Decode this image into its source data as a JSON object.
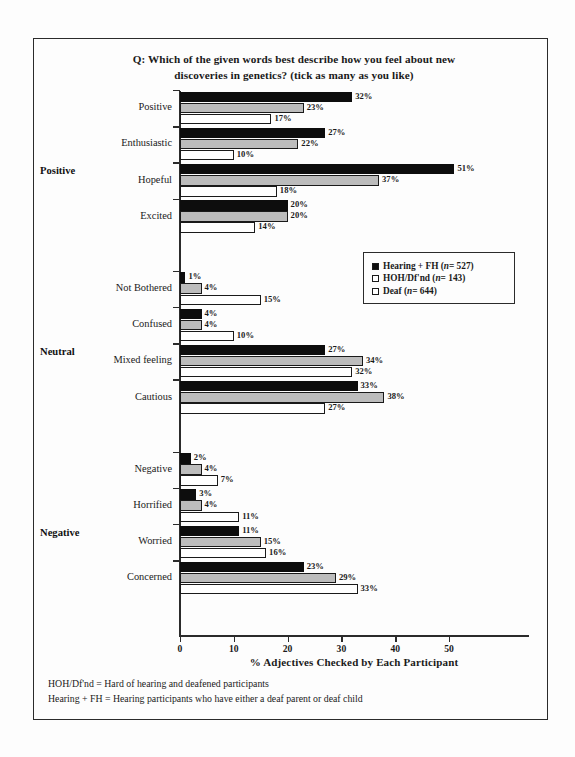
{
  "chart_data": {
    "type": "bar",
    "orientation": "horizontal",
    "title": "Q: Which of the given words best describe how you feel about new discoveries in genetics? (tick as many as you like)",
    "title_lines": [
      "Q: Which of the given words best describe how you feel about new",
      "discoveries in genetics? (tick as many as you like)"
    ],
    "xlabel": "%  Adjectives Checked by Each Participant",
    "ylabel": "",
    "xlim": [
      0,
      55
    ],
    "xticks": [
      0,
      10,
      20,
      30,
      40,
      50
    ],
    "xtick_labels": [
      "0",
      "10",
      "20",
      "30",
      "40",
      "50"
    ],
    "grid": false,
    "legend_position": "middle-right",
    "categories": [
      "Positive",
      "Enthusiastic",
      "Hopeful",
      "Excited",
      "Not Bothered",
      "Confused",
      "Mixed feeling",
      "Cautious",
      "Negative",
      "Horrified",
      "Worried",
      "Concerned"
    ],
    "groups": [
      {
        "name": "Positive",
        "categories": [
          "Positive",
          "Enthusiastic",
          "Hopeful",
          "Excited"
        ]
      },
      {
        "name": "Neutral",
        "categories": [
          "Not Bothered",
          "Confused",
          "Mixed feeling",
          "Cautious"
        ]
      },
      {
        "name": "Negative",
        "categories": [
          "Negative",
          "Horrified",
          "Worried",
          "Concerned"
        ]
      }
    ],
    "series": [
      {
        "name": "Hearing + FH (n = 527)",
        "short_name": "Hearing + FH",
        "n": 527,
        "color": "#0d0d0d",
        "values": [
          32,
          27,
          51,
          20,
          1,
          4,
          27,
          33,
          2,
          3,
          11,
          23
        ],
        "labels": [
          "32%",
          "27%",
          "51%",
          "20%",
          "1%",
          "4%",
          "27%",
          "33%",
          "2%",
          "3%",
          "11%",
          "23%"
        ]
      },
      {
        "name": "HOH/Df'nd (n = 143)",
        "short_name": "HOH/Df'nd",
        "n": 143,
        "color": "#bcbcbc",
        "values": [
          23,
          22,
          37,
          20,
          4,
          4,
          34,
          38,
          4,
          4,
          15,
          29
        ],
        "labels": [
          "23%",
          "22%",
          "37%",
          "20%",
          "4%",
          "4%",
          "34%",
          "38%",
          "4%",
          "4%",
          "15%",
          "29%"
        ]
      },
      {
        "name": "Deaf (n = 644)",
        "short_name": "Deaf",
        "n": 644,
        "color": "#ffffff",
        "values": [
          17,
          10,
          18,
          14,
          15,
          10,
          32,
          27,
          7,
          11,
          16,
          33
        ],
        "labels": [
          "17%",
          "10%",
          "18%",
          "14%",
          "15%",
          "10%",
          "32%",
          "27%",
          "7%",
          "11%",
          "16%",
          "33%"
        ]
      }
    ]
  },
  "legend": {
    "items": [
      {
        "label": "Hearing + FH (",
        "n_prefix": "n",
        "n_value": " = 527)",
        "swatch": "filled-black-square"
      },
      {
        "label": "HOH/Df'nd (",
        "n_prefix": "n",
        "n_value": " = 143)",
        "swatch": "outlined-square"
      },
      {
        "label": "Deaf (",
        "n_prefix": "n",
        "n_value": " = 644)",
        "swatch": "outlined-square"
      }
    ]
  },
  "footnotes": [
    "HOH/Df'nd = Hard of hearing and deafened participants",
    "Hearing + FH = Hearing participants who have either a deaf parent or deaf child"
  ]
}
